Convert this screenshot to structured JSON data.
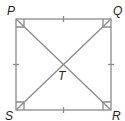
{
  "diagram": {
    "type": "square with diagonals",
    "vertices": {
      "P": "P",
      "Q": "Q",
      "R": "R",
      "S": "S"
    },
    "center": "T",
    "line_color": "#8a8a8a",
    "label_color": "#222222",
    "marks": {
      "congruent_sides": 4,
      "right_angles_at_corners": 4
    }
  }
}
